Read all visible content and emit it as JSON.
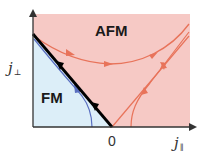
{
  "diagram": {
    "type": "rg-flow-phase-diagram",
    "axes": {
      "x_label": "j",
      "x_subscript": "∥",
      "y_label": "j",
      "y_subscript": "⊥",
      "origin_label": "0"
    },
    "regions": [
      {
        "name": "AFM",
        "label": "AFM",
        "color": "#f6c9c5"
      },
      {
        "name": "FM",
        "label": "FM",
        "color": "#dceef8"
      }
    ],
    "curves": [
      {
        "name": "phase-boundary",
        "color": "#000000",
        "description": "straight separatrix from j⊥ axis to origin",
        "arrows": 2
      },
      {
        "name": "fm-flow",
        "color": "#5a6fc0",
        "description": "flow inside FM region toward j∥ axis",
        "arrows": 1
      },
      {
        "name": "afm-top-flow",
        "color": "#e8735a",
        "description": "U-shaped flow in AFM region",
        "arrows": 3
      },
      {
        "name": "afm-diagonal",
        "color": "#e8735a",
        "description": "straight line from origin to upper right",
        "arrows": 1
      },
      {
        "name": "afm-right-flow",
        "color": "#e8735a",
        "description": "curve from j∥ axis to upper right",
        "arrows": 2
      }
    ],
    "colors": {
      "afm_fill": "#f6c9c5",
      "fm_fill": "#dceef8",
      "boundary": "#000000",
      "fm_flow": "#5a6fc0",
      "afm_flow": "#e8735a",
      "axis": "#333333"
    }
  }
}
